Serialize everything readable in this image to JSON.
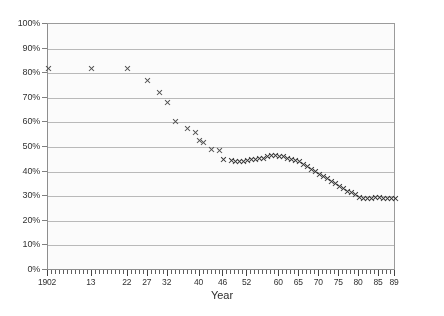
{
  "chart_data": {
    "type": "scatter",
    "title": "",
    "subtitle": "",
    "xlabel": "Year",
    "ylabel": "",
    "grid": true,
    "legend": null,
    "marker": "x",
    "marker_color": "#2e2e2e",
    "xlim": [
      1902,
      1989
    ],
    "ylim": [
      0,
      100
    ],
    "y_unit": "%",
    "yticks": [
      0,
      10,
      20,
      30,
      40,
      50,
      60,
      70,
      80,
      90,
      100
    ],
    "ytick_labels": [
      "0%",
      "10%",
      "20%",
      "30%",
      "40%",
      "50%",
      "60%",
      "70%",
      "80%",
      "90%",
      "100%"
    ],
    "xtick_labels": [
      "1902",
      "13",
      "22",
      "27",
      "32",
      "40",
      "46",
      "52",
      "60",
      "65",
      "70",
      "75",
      "80",
      "85",
      "89"
    ],
    "xtick_years": [
      1902,
      1913,
      1922,
      1927,
      1932,
      1940,
      1946,
      1952,
      1960,
      1965,
      1970,
      1975,
      1980,
      1985,
      1989
    ],
    "xtick_minor_step": 1,
    "x": [
      1902,
      1913,
      1922,
      1927,
      1930,
      1932,
      1934,
      1937,
      1939,
      1940,
      1941,
      1943,
      1945,
      1946,
      1948,
      1949,
      1950,
      1951,
      1952,
      1953,
      1954,
      1955,
      1956,
      1957,
      1958,
      1959,
      1960,
      1961,
      1962,
      1963,
      1964,
      1965,
      1966,
      1967,
      1968,
      1969,
      1970,
      1971,
      1972,
      1973,
      1974,
      1975,
      1976,
      1977,
      1978,
      1979,
      1980,
      1981,
      1982,
      1983,
      1984,
      1985,
      1986,
      1987,
      1988,
      1989
    ],
    "y": [
      82,
      82,
      82,
      77,
      72,
      68,
      60.5,
      57.5,
      56,
      52.5,
      52,
      49,
      48.5,
      45,
      44.5,
      44,
      44,
      44,
      44.5,
      45,
      45,
      45.5,
      45.5,
      46,
      46.5,
      46.5,
      46,
      46,
      45.5,
      45,
      44.5,
      44,
      43,
      42,
      41,
      40,
      39,
      38,
      37,
      36,
      35,
      34,
      33,
      32,
      31.5,
      30.5,
      29.5,
      29,
      29,
      29,
      29.5,
      29.5,
      29,
      29,
      29,
      29
    ],
    "annotations": [],
    "series_name": "percentage"
  },
  "axes": {
    "y_axis_name": "percent-axis",
    "x_axis_name": "year-axis"
  }
}
